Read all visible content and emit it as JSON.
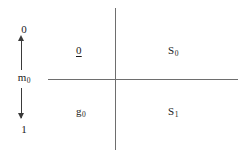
{
  "figure": {
    "background_color": "#ffffff",
    "line_color": "#6e6e6e",
    "axis_color": "#3a3a3a",
    "text_color": "#1a1a1a",
    "width": 245,
    "height": 157
  },
  "measure_axis": {
    "name": "vertical-measure-axis",
    "top_label": "0",
    "mid_label_base": "m",
    "mid_label_sub": "0",
    "bottom_label": "1",
    "arrow_up": "up-arrow",
    "arrow_down": "down-arrow"
  },
  "quadrants": {
    "top_left": {
      "base": "0",
      "sub": "",
      "underlined": true
    },
    "top_right": {
      "base": "S",
      "sub": "0",
      "underlined": false
    },
    "bottom_left": {
      "base": "g",
      "sub": "0",
      "underlined": false
    },
    "bottom_right": {
      "base": "S",
      "sub": "1",
      "underlined": false
    }
  },
  "cross": {
    "vertical_line": "vertical-divider",
    "horizontal_line": "horizontal-divider"
  }
}
